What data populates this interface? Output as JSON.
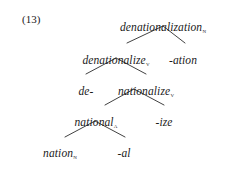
{
  "figure": {
    "example_number": "(13)",
    "type": "morphological-tree",
    "head_word": "denationalization"
  },
  "tree": {
    "nodes": [
      {
        "id": "denationalization",
        "text": "denationalization",
        "category": "N",
        "level": 0,
        "x": 163,
        "y": 22,
        "align": "center"
      },
      {
        "id": "denationalize",
        "text": "denationalize",
        "category": "V",
        "level": 1,
        "x": 116,
        "y": 55,
        "align": "center"
      },
      {
        "id": "ation",
        "text": "-ation",
        "category": "",
        "level": 1,
        "x": 183,
        "y": 55,
        "align": "center"
      },
      {
        "id": "de",
        "text": "de-",
        "category": "",
        "level": 2,
        "x": 86,
        "y": 86,
        "align": "center"
      },
      {
        "id": "nationalize",
        "text": "nationalize",
        "category": "V",
        "level": 2,
        "x": 146,
        "y": 86,
        "align": "center"
      },
      {
        "id": "national",
        "text": "national",
        "category": "A",
        "level": 3,
        "x": 96,
        "y": 117,
        "align": "center"
      },
      {
        "id": "ize",
        "text": "-ize",
        "category": "",
        "level": 3,
        "x": 164,
        "y": 117,
        "align": "center"
      },
      {
        "id": "nation",
        "text": "nation",
        "category": "N",
        "level": 4,
        "x": 60,
        "y": 148,
        "align": "center"
      },
      {
        "id": "al",
        "text": "-al",
        "category": "",
        "level": 4,
        "x": 124,
        "y": 148,
        "align": "center"
      }
    ],
    "branches": [
      {
        "parent": "denationalization",
        "child": "denationalize",
        "x1": 163,
        "y1": 26,
        "x2": 127,
        "y2": 43
      },
      {
        "parent": "denationalization",
        "child": "ation",
        "x1": 163,
        "y1": 26,
        "x2": 185,
        "y2": 43
      },
      {
        "parent": "denationalize",
        "child": "de",
        "x1": 116,
        "y1": 58,
        "x2": 86,
        "y2": 74
      },
      {
        "parent": "denationalize",
        "child": "nationalize",
        "x1": 116,
        "y1": 58,
        "x2": 146,
        "y2": 74
      },
      {
        "parent": "nationalize",
        "child": "national",
        "x1": 134,
        "y1": 89,
        "x2": 105,
        "y2": 105
      },
      {
        "parent": "nationalize",
        "child": "ize",
        "x1": 134,
        "y1": 89,
        "x2": 164,
        "y2": 105
      },
      {
        "parent": "national",
        "child": "nation",
        "x1": 95,
        "y1": 121,
        "x2": 65,
        "y2": 137
      },
      {
        "parent": "national",
        "child": "al",
        "x1": 95,
        "y1": 121,
        "x2": 125,
        "y2": 137
      }
    ]
  },
  "style": {
    "background_color": "#ffffff",
    "text_color": "#1a1a1a",
    "line_color": "#2b2b2b"
  }
}
